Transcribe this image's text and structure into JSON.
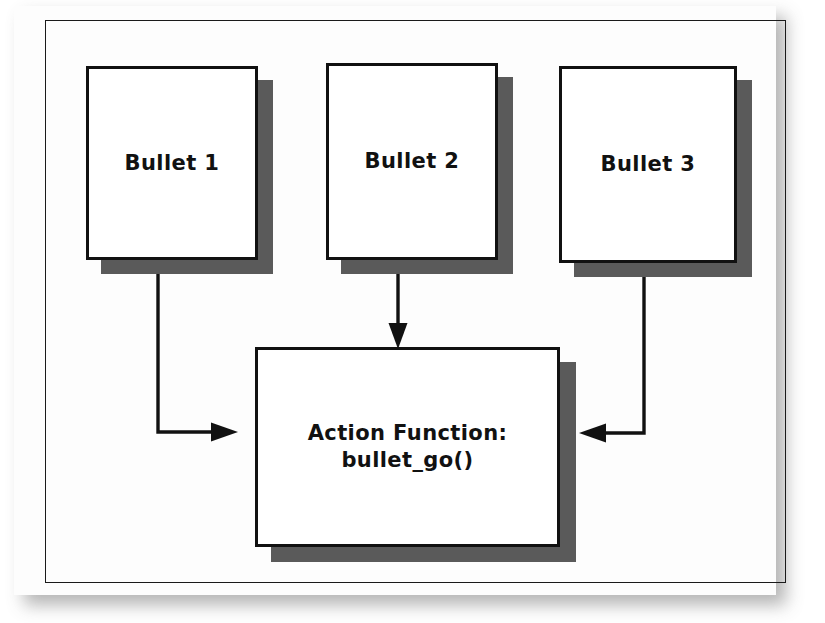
{
  "figure": {
    "kind": "flowchart-diagram",
    "frame_visible": true,
    "colors": {
      "page": "#fdfdfd",
      "box_fill": "#ffffff",
      "box_border": "#111111",
      "box_shadow": "#5a5a5a",
      "line": "#111111",
      "text": "#111111"
    },
    "nodes": [
      {
        "id": "bullet-1",
        "label": "Bullet 1"
      },
      {
        "id": "bullet-2",
        "label": "Bullet 2"
      },
      {
        "id": "bullet-3",
        "label": "Bullet 3"
      },
      {
        "id": "action-box",
        "label_line_1": "Action Function:",
        "label_line_2": "bullet_go()"
      }
    ],
    "connectors": [
      {
        "id": "arrow-bullet1-to-action",
        "from": "bullet-1",
        "to": "action-box",
        "style": "elbow",
        "direction": "right"
      },
      {
        "id": "arrow-bullet2-to-action",
        "from": "bullet-2",
        "to": "action-box",
        "style": "straight",
        "direction": "down"
      },
      {
        "id": "arrow-bullet3-to-action",
        "from": "bullet-3",
        "to": "action-box",
        "style": "elbow",
        "direction": "left"
      }
    ]
  }
}
